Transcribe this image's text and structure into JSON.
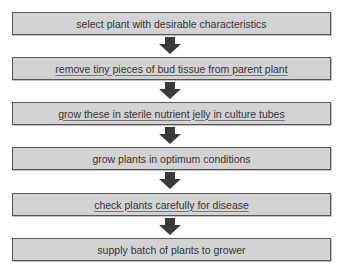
{
  "diagram": {
    "type": "flowchart",
    "direction": "top-to-bottom",
    "colors": {
      "box_fill": "#d3d3d3",
      "box_border": "#555555",
      "arrow": "#3a3a3a",
      "text": "#333333"
    },
    "steps": [
      {
        "label": "select plant with desirable characteristics",
        "underlined": false
      },
      {
        "label": "remove tiny pieces of bud tissue from parent plant",
        "underlined": true
      },
      {
        "label": "grow these in sterile nutrient jelly in culture tubes",
        "underlined": true
      },
      {
        "label": "grow plants in optimum conditions",
        "underlined": false
      },
      {
        "label": "check plants carefully for disease",
        "underlined": true
      },
      {
        "label": "supply batch of plants to grower",
        "underlined": false
      }
    ],
    "arrows": [
      {
        "from": 0,
        "to": 1,
        "icon": "down-arrow-icon"
      },
      {
        "from": 1,
        "to": 2,
        "icon": "down-arrow-icon"
      },
      {
        "from": 2,
        "to": 3,
        "icon": "down-arrow-icon"
      },
      {
        "from": 3,
        "to": 4,
        "icon": "down-arrow-icon"
      },
      {
        "from": 4,
        "to": 5,
        "icon": "down-arrow-icon"
      }
    ]
  }
}
